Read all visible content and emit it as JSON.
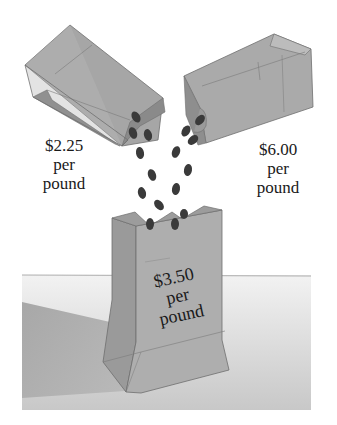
{
  "illustration": {
    "subject": "Mixing coffee beans from two bags into one",
    "bags": [
      {
        "id": "left",
        "price": "$2.25",
        "unit_line1": "per",
        "unit_line2": "pound"
      },
      {
        "id": "right",
        "price": "$6.00",
        "unit_line1": "per",
        "unit_line2": "pound"
      },
      {
        "id": "bottom",
        "price": "$3.50",
        "unit_line1": "per",
        "unit_line2": "pound"
      }
    ]
  },
  "colors": {
    "bag_fill": "#a9a9a9",
    "bag_shade": "#8f8f8f",
    "bag_light": "#bdbdbd",
    "bag_stroke": "#6e6e6e",
    "bean": "#3a3a3a",
    "table_light": "#ececec",
    "table_shadow": "#b4b4b4",
    "background": "#ffffff"
  }
}
